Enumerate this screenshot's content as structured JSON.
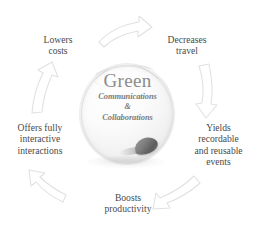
{
  "diagram": {
    "type": "cycle",
    "direction": "clockwise",
    "background_color": "#ffffff",
    "label_color": "#4a4a4a",
    "arrow_color": "#e3e3e3",
    "brand_color": "#8c8c8c"
  },
  "center": {
    "title": "Green",
    "subtitle_line1": "Communications",
    "subtitle_amp": "&",
    "subtitle_line2": "Collaborations",
    "icon_name": "glass-sphere-with-mouse"
  },
  "benefits": [
    {
      "id": "decreases-travel",
      "lines": [
        "Decreases",
        "travel"
      ]
    },
    {
      "id": "yields-events",
      "lines": [
        "Yields",
        "recordable",
        "and reusable",
        "events"
      ]
    },
    {
      "id": "boosts-productivity",
      "lines": [
        "Boosts",
        "productivity"
      ]
    },
    {
      "id": "offers-interactive",
      "lines": [
        "Offers fully",
        "interactive",
        "interactions"
      ]
    },
    {
      "id": "lowers-costs",
      "lines": [
        "Lowers",
        "costs"
      ]
    }
  ],
  "arrows": [
    {
      "id": "arrow-top",
      "direction": "right"
    },
    {
      "id": "arrow-right",
      "direction": "down"
    },
    {
      "id": "arrow-bottom-right",
      "direction": "down-left"
    },
    {
      "id": "arrow-bottom-left",
      "direction": "up-left"
    },
    {
      "id": "arrow-left",
      "direction": "up"
    }
  ]
}
